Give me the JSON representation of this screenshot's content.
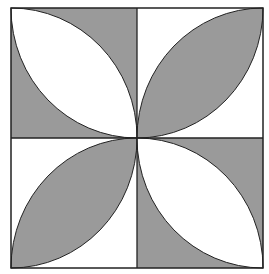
{
  "figure": {
    "grid": {
      "rows": 2,
      "cols": 2
    },
    "colors": {
      "fill_dark": "#9a9a9a",
      "fill_light": "#ffffff",
      "stroke": "#222222"
    },
    "quadrants": [
      {
        "position": "top-left",
        "background": "gray",
        "lens": "white",
        "lens_direction": "top-left to bottom-right"
      },
      {
        "position": "top-right",
        "background": "white",
        "lens": "gray",
        "lens_direction": "bottom-left to top-right"
      },
      {
        "position": "bottom-left",
        "background": "white",
        "lens": "gray",
        "lens_direction": "bottom-left to top-right"
      },
      {
        "position": "bottom-right",
        "background": "gray",
        "lens": "white",
        "lens_direction": "top-left to bottom-right"
      }
    ]
  }
}
